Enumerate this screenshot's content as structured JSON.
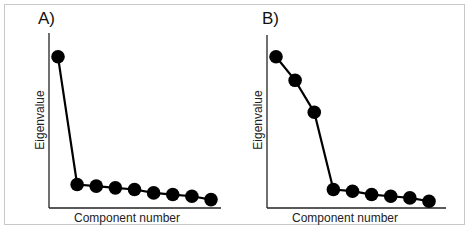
{
  "figure": {
    "panels": [
      {
        "label": "A)",
        "ylabel": "Eigenvalue",
        "xlabel": "Component number"
      },
      {
        "label": "B)",
        "ylabel": "Eigenvalue",
        "xlabel": "Component number"
      }
    ],
    "colors": {
      "frame": "#c8c8c8",
      "axis": "#222222",
      "series": "#000000"
    }
  },
  "chart_data": [
    {
      "type": "line",
      "title": "A)",
      "xlabel": "Component number",
      "ylabel": "Eigenvalue",
      "x": [
        1,
        2,
        3,
        4,
        5,
        6,
        7,
        8,
        9
      ],
      "values": [
        9.0,
        1.4,
        1.3,
        1.2,
        1.1,
        0.9,
        0.8,
        0.7,
        0.5
      ],
      "markers": "filled-circle",
      "grid": false,
      "ticks": false,
      "ylim": [
        0,
        10
      ],
      "note": "Scree plot with a single dominant component (elbow after component 1); values approximate, axes unlabeled"
    },
    {
      "type": "line",
      "title": "B)",
      "xlabel": "Component number",
      "ylabel": "Eigenvalue",
      "x": [
        1,
        2,
        3,
        4,
        5,
        6,
        7,
        8,
        9
      ],
      "values": [
        9.0,
        7.6,
        5.7,
        1.1,
        1.0,
        0.8,
        0.7,
        0.6,
        0.4
      ],
      "markers": "filled-circle",
      "grid": false,
      "ticks": false,
      "ylim": [
        0,
        10
      ],
      "note": "Scree plot with three dominant components (elbow after component 3); values approximate, axes unlabeled"
    }
  ]
}
